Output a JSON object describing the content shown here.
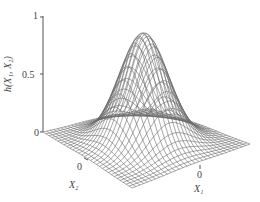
{
  "chart_data": {
    "type": "surface3d",
    "title": "",
    "function": "h(X1, X2) — bell-shaped (Gaussian-like) surface peaking at 1 at X1=0, X2=0",
    "xlabel": "X1",
    "ylabel": "X2",
    "zlabel": "h(X1, X2)",
    "z_ticks": [
      "0",
      "0.5",
      "1"
    ],
    "x_ticks": [
      "0"
    ],
    "y_ticks": [
      "0"
    ],
    "zlim": [
      0,
      1
    ],
    "peak": {
      "x1": 0,
      "x2": 0,
      "z": 1
    },
    "grid": "wireframe mesh",
    "legend": null
  },
  "labels": {
    "z_tick_1": "1",
    "z_tick_05": "0.5",
    "z_tick_0": "0",
    "zlabel": "h(X₁, X₂)",
    "x2_tick": "0",
    "x2_label": "X₂",
    "x1_tick": "0",
    "x1_label": "X₁"
  }
}
